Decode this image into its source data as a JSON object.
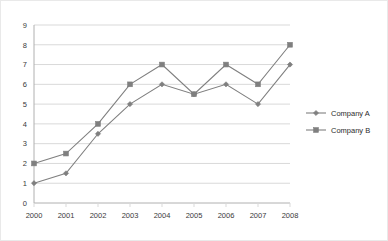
{
  "chart_data": {
    "type": "line",
    "title": "",
    "xlabel": "",
    "ylabel": "",
    "categories": [
      "2000",
      "2001",
      "2002",
      "2003",
      "2004",
      "2005",
      "2006",
      "2007",
      "2008"
    ],
    "x": [
      2000,
      2001,
      2002,
      2003,
      2004,
      2005,
      2006,
      2007,
      2008
    ],
    "ylim": [
      0,
      9
    ],
    "xlim": [
      2000,
      2008
    ],
    "yticks": [
      "0",
      "1",
      "2",
      "3",
      "4",
      "5",
      "6",
      "7",
      "8",
      "9"
    ],
    "ytick_values": [
      0,
      1,
      2,
      3,
      4,
      5,
      6,
      7,
      8,
      9
    ],
    "grid": true,
    "grid_axis": "y",
    "legend_position": "right",
    "series": [
      {
        "name": "Company A",
        "marker": "diamond",
        "color": "#808080",
        "values": [
          1,
          1.5,
          3.5,
          5,
          6,
          5.5,
          6,
          5,
          7
        ]
      },
      {
        "name": "Company B",
        "marker": "square",
        "color": "#808080",
        "values": [
          2,
          2.5,
          4,
          6,
          7,
          5.5,
          7,
          6,
          8
        ]
      }
    ]
  },
  "style": {
    "line_color": "#808080",
    "marker_color": "#7f7f7f",
    "grid_color": "#d9d9d9",
    "axis_color": "#b0b0b0",
    "text_color": "#3a3a3a",
    "border_color": "#e9e9e9",
    "background": "#ffffff"
  }
}
